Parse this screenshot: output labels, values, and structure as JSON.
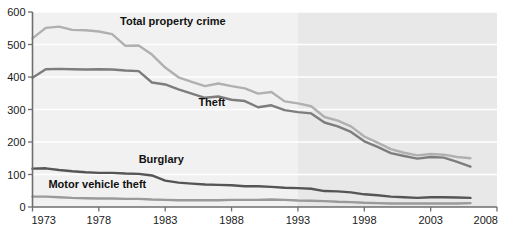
{
  "chart_data": {
    "type": "line",
    "title": "",
    "xlabel": "",
    "ylabel": "",
    "xlim": [
      1973,
      2008
    ],
    "ylim": [
      0,
      600
    ],
    "grid": true,
    "legend_position": "inline-labels",
    "x_ticks": [
      "1973",
      "1978",
      "1983",
      "1988",
      "1993",
      "1998",
      "2003",
      "2008"
    ],
    "x_tick_values": [
      1973,
      1978,
      1983,
      1988,
      1993,
      1998,
      2003,
      2008
    ],
    "y_ticks": [
      "0",
      "100",
      "200",
      "300",
      "400",
      "500",
      "600"
    ],
    "y_tick_values": [
      0,
      100,
      200,
      300,
      400,
      500,
      600
    ],
    "shaded_band": {
      "label": "",
      "x_start": 1993,
      "x_end": 2008,
      "color": "#e8e8e8"
    },
    "plot_background": "#f1f1f1",
    "x": [
      1973,
      1974,
      1975,
      1976,
      1977,
      1978,
      1979,
      1980,
      1981,
      1982,
      1983,
      1984,
      1985,
      1986,
      1987,
      1988,
      1989,
      1990,
      1991,
      1992,
      1993,
      1994,
      1995,
      1996,
      1997,
      1998,
      1999,
      2000,
      2001,
      2002,
      2003,
      2004,
      2005,
      2006
    ],
    "series": [
      {
        "name": "Total property crime",
        "color": "#b0b0b0",
        "label_x": 1979.6,
        "label_y": 560,
        "values": [
          519,
          551,
          555,
          545,
          544,
          540,
          532,
          496,
          497,
          469,
          429,
          399,
          385,
          372,
          380,
          372,
          365,
          349,
          354,
          325,
          319,
          310,
          277,
          266,
          248,
          217,
          198,
          178,
          167,
          159,
          163,
          161,
          154,
          150
        ]
      },
      {
        "name": "Theft",
        "color": "#7d7d7d",
        "label_x": 1985.5,
        "label_y": 312,
        "values": [
          398,
          424,
          425,
          424,
          423,
          424,
          423,
          420,
          418,
          383,
          377,
          362,
          349,
          336,
          340,
          330,
          326,
          307,
          313,
          298,
          292,
          288,
          260,
          248,
          231,
          202,
          185,
          166,
          157,
          149,
          154,
          152,
          139,
          124
        ]
      },
      {
        "name": "Burglary",
        "color": "#555555",
        "label_x": 1981.0,
        "label_y": 136,
        "values": [
          118,
          119,
          114,
          110,
          107,
          105,
          105,
          103,
          102,
          97,
          81,
          75,
          72,
          69,
          68,
          67,
          64,
          64,
          62,
          59,
          58,
          56,
          49,
          48,
          45,
          39,
          36,
          32,
          30,
          28,
          30,
          30,
          29,
          28
        ]
      },
      {
        "name": "Motor vehicle theft",
        "color": "#9a9a9a",
        "label_x": 1974.2,
        "label_y": 60,
        "values": [
          32,
          32,
          30,
          28,
          27,
          26,
          26,
          25,
          25,
          23,
          22,
          21,
          21,
          21,
          21,
          22,
          22,
          22,
          23,
          22,
          20,
          19,
          18,
          16,
          15,
          13,
          12,
          11,
          11,
          11,
          11,
          11,
          11,
          12
        ]
      }
    ]
  },
  "series_labels": {
    "total_property_crime": "Total property crime",
    "theft": "Theft",
    "burglary": "Burglary",
    "motor_vehicle_theft": "Motor vehicle theft"
  }
}
